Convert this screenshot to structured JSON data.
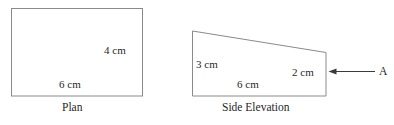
{
  "diagram": {
    "stroke_color": "#8a8a8a",
    "annotation_color": "#3a3a3a",
    "text_color": "#1f1f1f",
    "background_color": "#ffffff",
    "plan": {
      "caption": "Plan",
      "shape": "rectangle",
      "width_label": "6 cm",
      "height_label": "4 cm",
      "width_value": 6,
      "height_value": 4,
      "unit": "cm"
    },
    "side_elevation": {
      "caption": "Side Elevation",
      "shape": "trapezium",
      "left_height_label": "3 cm",
      "right_height_label": "2 cm",
      "base_label": "6 cm",
      "left_height_value": 3,
      "right_height_value": 2,
      "base_value": 6,
      "unit": "cm"
    },
    "annotation": {
      "point_label": "A",
      "arrow_direction": "left"
    }
  }
}
